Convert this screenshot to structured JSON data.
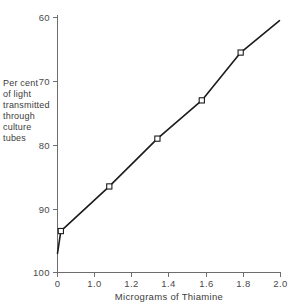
{
  "chart_data": {
    "type": "line",
    "title": "",
    "xlabel": "Micrograms of Thiamine",
    "ylabel": "Per cent of light transmitted through culture tubes",
    "ylabel_lines": [
      "Per cent",
      "of light",
      "transmitted",
      "through",
      "culture",
      "tubes"
    ],
    "x": [
      0.0,
      0.09,
      1.08,
      1.34,
      1.58,
      1.79,
      2.0
    ],
    "values": [
      97.0,
      93.5,
      86.5,
      79.0,
      73.0,
      65.5,
      60.5
    ],
    "marker_x": [
      0.09,
      1.08,
      1.34,
      1.58,
      1.79
    ],
    "marker_values": [
      93.5,
      86.5,
      79.0,
      73.0,
      65.5
    ],
    "xticks": [
      0.0,
      1.0,
      1.2,
      1.4,
      1.6,
      1.8,
      2.0
    ],
    "xticklabels": [
      "0",
      "1.0",
      "1.2",
      "1.4",
      "1.6",
      "1.8",
      "2.0"
    ],
    "yticks": [
      60,
      70,
      80,
      90,
      100
    ],
    "yticklabels": [
      "60",
      "70",
      "80",
      "90",
      "100"
    ],
    "xlim": [
      0.0,
      2.0
    ],
    "ylim": [
      100,
      60
    ],
    "y_axis_inverted": true,
    "grid": false,
    "legend": false,
    "marker_style": "open-square",
    "line_color": "#1b1b1b",
    "axis_color": "#6d6d6d",
    "background_color": "#ffffff"
  },
  "axes": {
    "x_title": "Micrograms of Thiamine",
    "y_title_lines": [
      "Per cent",
      "of light",
      "transmitted",
      "through",
      "culture",
      "tubes"
    ]
  }
}
